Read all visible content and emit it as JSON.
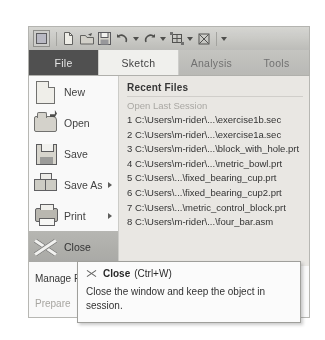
{
  "app": {
    "quick_access": [
      {
        "name": "app-menu-icon",
        "label": "Application Menu"
      },
      {
        "name": "new-icon",
        "label": "New"
      },
      {
        "name": "open-icon",
        "label": "Open"
      },
      {
        "name": "save-icon",
        "label": "Save"
      },
      {
        "name": "undo-icon",
        "label": "Undo"
      },
      {
        "name": "redo-icon",
        "label": "Redo"
      },
      {
        "name": "regenerate-icon",
        "label": "Regenerate"
      },
      {
        "name": "close-window-icon",
        "label": "Close Window"
      },
      {
        "name": "customize-caret-icon",
        "label": "Customize Quick Access Toolbar"
      }
    ]
  },
  "ribbon": {
    "tabs": [
      {
        "label": "File",
        "state": "active"
      },
      {
        "label": "Sketch",
        "state": "selected"
      },
      {
        "label": "Analysis",
        "state": "normal"
      },
      {
        "label": "Tools",
        "state": "normal"
      }
    ]
  },
  "menu": {
    "items": [
      {
        "label": "New",
        "icon": "new-document-icon",
        "submenu": false,
        "highlighted": false
      },
      {
        "label": "Open",
        "icon": "open-folder-icon",
        "submenu": false,
        "highlighted": false
      },
      {
        "label": "Save",
        "icon": "save-floppy-icon",
        "submenu": false,
        "highlighted": false
      },
      {
        "label": "Save As",
        "icon": "save-as-icon",
        "submenu": true,
        "highlighted": false
      },
      {
        "label": "Print",
        "icon": "printer-icon",
        "submenu": true,
        "highlighted": false
      },
      {
        "label": "Close",
        "icon": "close-x-icon",
        "submenu": false,
        "highlighted": true
      }
    ],
    "bottom_labels": [
      {
        "label": "Manage F",
        "muted": false
      },
      {
        "label": "Prepare",
        "muted": true
      }
    ]
  },
  "recent": {
    "title": "Recent Files",
    "subtitle": "Open Last Session",
    "files": [
      "1 C:\\Users\\m-rider\\...\\exercise1b.sec",
      "2 C:\\Users\\m-rider\\...\\exercise1a.sec",
      "3 C:\\Users\\m-rider\\...\\block_with_hole.prt",
      "4 C:\\Users\\m-rider\\...\\metric_bowl.prt",
      "5 C:\\Users\\...\\fixed_bearing_cup.prt",
      "6 C:\\Users\\...\\fixed_bearing_cup2.prt",
      "7 C:\\Users\\...\\metric_control_block.prt",
      "8 C:\\Users\\m-rider\\...\\four_bar.asm"
    ]
  },
  "tooltip": {
    "icon": "close-x-icon",
    "title": "Close",
    "shortcut": "(Ctrl+W)",
    "body": "Close the window and keep the object in session."
  },
  "colors": {
    "tab_active_bg": "#4b4b4b",
    "tab_selected_bg": "#f3f3f0",
    "ribbon_bg": "#b9b9b5",
    "panel_bg": "#eceae6",
    "highlight_bg": "#b6b6b2",
    "tooltip_bg": "#ffffff"
  }
}
